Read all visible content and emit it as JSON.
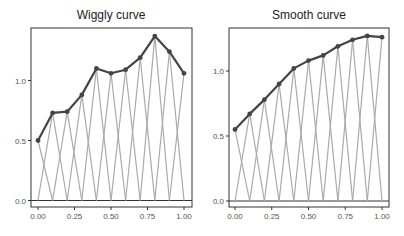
{
  "chart_data": [
    {
      "type": "line",
      "title": "Wiggly curve",
      "xlabel": "",
      "ylabel": "",
      "x": [
        0.0,
        0.1,
        0.2,
        0.3,
        0.4,
        0.5,
        0.6,
        0.7,
        0.8,
        0.9,
        1.0
      ],
      "series": [
        {
          "name": "curve",
          "values": [
            0.5,
            0.73,
            0.74,
            0.88,
            1.1,
            1.06,
            1.09,
            1.19,
            1.37,
            1.24,
            1.06
          ]
        }
      ],
      "xticks": [
        "0.00",
        "0.25",
        "0.50",
        "0.75",
        "1.00"
      ],
      "yticks": [
        "0.0",
        "0.5",
        "1.0"
      ],
      "xlim": [
        -0.05,
        1.05
      ],
      "ylim": [
        -0.05,
        1.43
      ],
      "grid": false,
      "annotations": "grey zig-zag lines connect each curve point to the x-axis at the neighbouring x positions"
    },
    {
      "type": "line",
      "title": "Smooth curve",
      "xlabel": "",
      "ylabel": "",
      "x": [
        0.0,
        0.1,
        0.2,
        0.3,
        0.4,
        0.5,
        0.6,
        0.7,
        0.8,
        0.9,
        1.0
      ],
      "series": [
        {
          "name": "curve",
          "values": [
            0.55,
            0.67,
            0.78,
            0.9,
            1.02,
            1.08,
            1.12,
            1.19,
            1.24,
            1.27,
            1.26
          ]
        }
      ],
      "xticks": [
        "0.00",
        "0.25",
        "0.50",
        "0.75",
        "1.00"
      ],
      "yticks": [
        "0.0",
        "0.5",
        "1.0"
      ],
      "xlim": [
        -0.05,
        1.05
      ],
      "ylim": [
        -0.05,
        1.33
      ],
      "grid": false,
      "annotations": "grey zig-zag lines connect each curve point to the x-axis at the neighbouring x positions"
    }
  ],
  "panels": [
    {
      "title": "Wiggly curve"
    },
    {
      "title": "Smooth curve"
    }
  ]
}
